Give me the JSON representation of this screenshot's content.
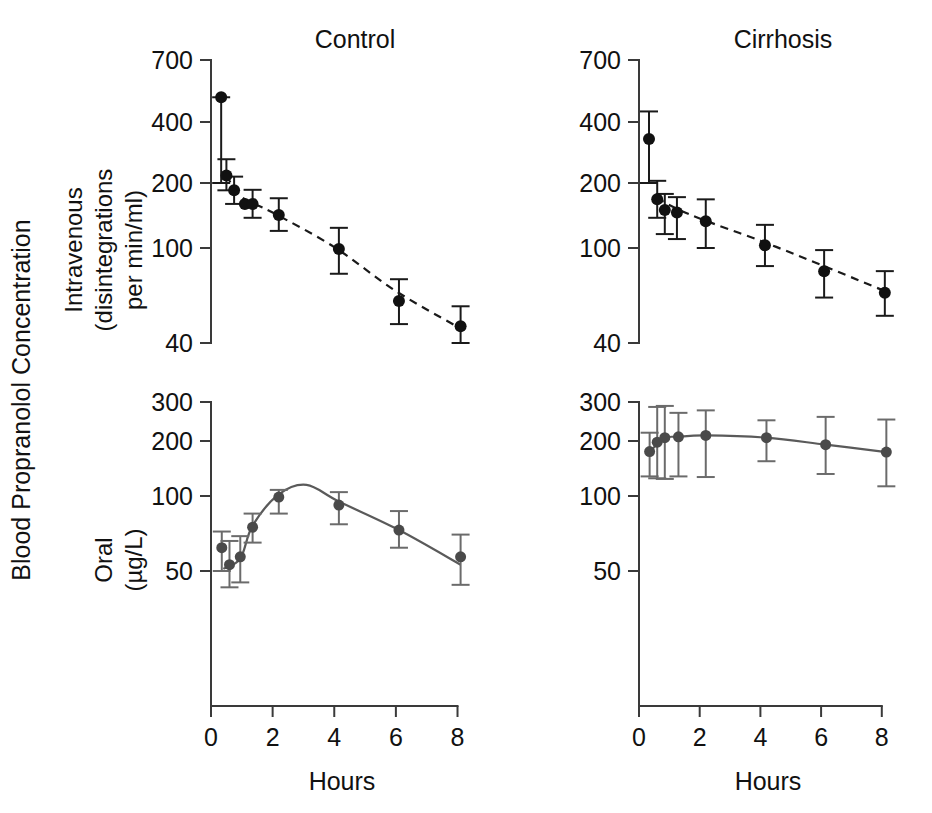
{
  "figure": {
    "outer_y_label": "Blood Propranolol Concentration",
    "x_axis_label": "Hours",
    "colors": {
      "iv_marker": "#111111",
      "iv_error": "#1a1a1a",
      "iv_fit": "#1a1a1a",
      "oral_marker": "#4a4a4a",
      "oral_error": "#6b6b6b",
      "oral_fit": "#5a5a5a",
      "axis": "#3a3a3a",
      "text": "#111111",
      "background": "#ffffff"
    },
    "columns": [
      {
        "title": "Control"
      },
      {
        "title": "Cirrhosis"
      }
    ],
    "rows": [
      {
        "label_line1": "Intravenous",
        "label_line2": "(disintegrations",
        "label_line3": "per min/ml)"
      },
      {
        "label_line1": "Oral",
        "label_line2": "(µg/L)"
      }
    ]
  },
  "chart_data": [
    {
      "id": "iv-control",
      "type": "scatter",
      "title": "Control",
      "subplot": "Intravenous",
      "xlabel": "Hours",
      "ylabel": "Intravenous (disintegrations per min/ml)",
      "yscale": "log",
      "ylim": [
        40,
        700
      ],
      "yticks": [
        700,
        400,
        200,
        100,
        40
      ],
      "xlim": [
        0,
        8.6
      ],
      "xticks": [
        0,
        2,
        4,
        6,
        8
      ],
      "grid": false,
      "legend": "none",
      "fit_style": "dashed",
      "x": [
        0.33,
        0.5,
        0.75,
        1.1,
        1.35,
        2.2,
        4.15,
        6.1,
        8.1
      ],
      "y": [
        500,
        218,
        185,
        160,
        160,
        142,
        99,
        60,
        47
      ],
      "yerr_low": [
        200,
        185,
        160,
        138,
        138,
        120,
        78,
        48,
        40
      ],
      "yerr_high": [
        500,
        262,
        215,
        186,
        186,
        170,
        124,
        74,
        57
      ],
      "has_point_errorbar": [
        true,
        true,
        true,
        false,
        true,
        true,
        true,
        true,
        true
      ],
      "fit_points_x": [
        0.5,
        1.0,
        2.0,
        4.0,
        6.0,
        8.1
      ],
      "fit_points_y": [
        218,
        172,
        146,
        101,
        66,
        46
      ]
    },
    {
      "id": "iv-cirrhosis",
      "type": "scatter",
      "title": "Cirrhosis",
      "subplot": "Intravenous",
      "xlabel": "Hours",
      "ylabel": "Intravenous (disintegrations per min/ml)",
      "yscale": "log",
      "ylim": [
        40,
        700
      ],
      "yticks": [
        700,
        400,
        200,
        100,
        40
      ],
      "xlim": [
        0,
        8.6
      ],
      "xticks": [
        0,
        2,
        4,
        6,
        8
      ],
      "grid": false,
      "legend": "none",
      "fit_style": "dashed",
      "x": [
        0.33,
        0.6,
        0.85,
        1.25,
        2.2,
        4.15,
        6.1,
        8.1
      ],
      "y": [
        330,
        168,
        150,
        146,
        133,
        103,
        80,
        65
      ],
      "yerr_low": [
        200,
        138,
        116,
        110,
        100,
        84,
        62,
        52
      ],
      "yerr_high": [
        440,
        205,
        178,
        172,
        168,
        128,
        98,
        80
      ],
      "has_point_errorbar": [
        true,
        true,
        true,
        true,
        true,
        true,
        true,
        true
      ],
      "fit_points_x": [
        0.6,
        1.0,
        2.0,
        4.0,
        6.0,
        8.1
      ],
      "fit_points_y": [
        172,
        158,
        137,
        108,
        85,
        66
      ]
    },
    {
      "id": "oral-control",
      "type": "scatter",
      "title": "Control",
      "subplot": "Oral",
      "xlabel": "Hours",
      "ylabel": "Oral (µg/L)",
      "yscale": "log",
      "ylim": [
        30,
        300
      ],
      "yticks": [
        300,
        200,
        100,
        50
      ],
      "xlim": [
        0,
        8.6
      ],
      "xticks": [
        0,
        2,
        4,
        6,
        8
      ],
      "grid": false,
      "legend": "none",
      "fit_style": "solid",
      "x": [
        0.35,
        0.6,
        0.95,
        1.35,
        2.2,
        4.15,
        6.1,
        8.1
      ],
      "y": [
        62,
        53,
        57,
        75,
        99,
        92,
        73,
        57
      ],
      "yerr_low": [
        50,
        43,
        45,
        65,
        85,
        77,
        62,
        44
      ],
      "yerr_high": [
        72,
        66,
        69,
        85,
        108,
        105,
        87,
        70
      ],
      "has_point_errorbar": [
        true,
        true,
        true,
        true,
        true,
        true,
        true,
        true
      ],
      "fit_points_x": [
        0.4,
        0.95,
        1.35,
        2.2,
        3.1,
        4.15,
        6.1,
        8.1
      ],
      "fit_points_y": [
        51,
        56,
        76,
        102,
        115,
        95,
        73,
        53
      ]
    },
    {
      "id": "oral-cirrhosis",
      "type": "scatter",
      "title": "Cirrhosis",
      "subplot": "Oral",
      "xlabel": "Hours",
      "ylabel": "Oral (µg/L)",
      "yscale": "log",
      "ylim": [
        30,
        300
      ],
      "yticks": [
        300,
        200,
        100,
        50
      ],
      "xlim": [
        0,
        8.6
      ],
      "xticks": [
        0,
        2,
        4,
        6,
        8
      ],
      "grid": false,
      "legend": "none",
      "fit_style": "solid",
      "x": [
        0.35,
        0.6,
        0.85,
        1.3,
        2.2,
        4.2,
        6.15,
        8.15
      ],
      "y": [
        175,
        197,
        207,
        209,
        212,
        207,
        191,
        174
      ],
      "yerr_low": [
        128,
        125,
        124,
        128,
        127,
        155,
        132,
        113
      ],
      "yerr_high": [
        218,
        285,
        288,
        268,
        275,
        248,
        257,
        250
      ],
      "has_point_errorbar": [
        true,
        true,
        true,
        true,
        true,
        true,
        true,
        true
      ],
      "fit_points_x": [
        0.35,
        0.85,
        1.3,
        2.2,
        4.2,
        6.15,
        8.15
      ],
      "fit_points_y": [
        175,
        206,
        209,
        212,
        207,
        191,
        174
      ]
    }
  ]
}
